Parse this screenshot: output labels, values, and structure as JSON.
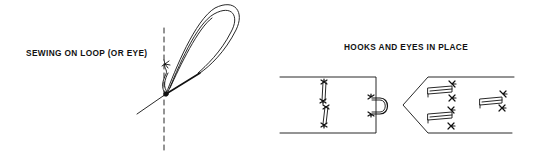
{
  "figures": [
    {
      "id": "sewing-loop",
      "caption": "SEWING ON LOOP (OR EYE)"
    },
    {
      "id": "hooks-eyes",
      "caption": "HOOKS AND EYES IN PLACE"
    }
  ],
  "colors": {
    "ink": "#111111",
    "background": "#ffffff"
  }
}
